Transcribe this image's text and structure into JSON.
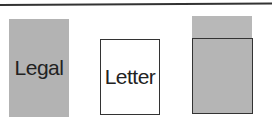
{
  "diagram": {
    "items": [
      {
        "label": "Legal",
        "style": "gray-filled"
      },
      {
        "label": "Letter",
        "style": "white-outlined"
      },
      {
        "label": "",
        "style": "letter-overlaid-on-legal"
      }
    ],
    "colors": {
      "gray": "#b3b3b3",
      "border": "#333333",
      "background": "#ffffff"
    }
  }
}
